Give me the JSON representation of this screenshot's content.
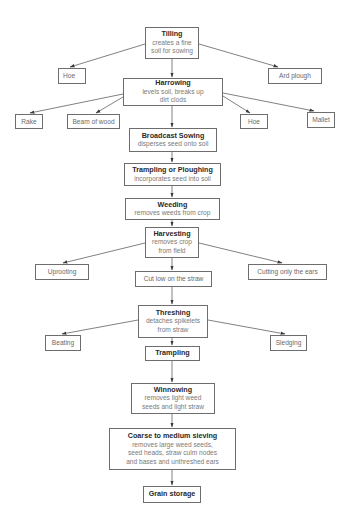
{
  "diagram": {
    "type": "flowchart",
    "title": "",
    "nodes": {
      "tilling": {
        "title": "Tilling",
        "desc": "creates a fine\nsoil for sowing"
      },
      "hoe1": {
        "label": "Hoe"
      },
      "ard_plough": {
        "label": "Ard plough"
      },
      "harrowing": {
        "title": "Harrowing",
        "desc": "levels soil, breaks up\ndirt clods"
      },
      "rake": {
        "label": "Rake"
      },
      "beam_of_wood": {
        "label": "Beam of wood"
      },
      "hoe2": {
        "label": "Hoe"
      },
      "mallet": {
        "label": "Mallet"
      },
      "broadcast_sowing": {
        "title": "Broadcast Sowing",
        "desc": "disperses seed onto soil"
      },
      "trampling_ploughing": {
        "title": "Trampling or Ploughing",
        "desc": "incorporates seed into soil"
      },
      "weeding": {
        "title": "Weeding",
        "desc": "removes weeds from crop"
      },
      "harvesting": {
        "title": "Harvesting",
        "desc": "removes crop\nfrom field"
      },
      "uprooting": {
        "label": "Uprooting"
      },
      "cut_low": {
        "label": "Cut low on the straw"
      },
      "cutting_ears": {
        "label": "Cutting only the ears"
      },
      "threshing": {
        "title": "Threshing",
        "desc": "detaches spikelets\nfrom straw"
      },
      "beating": {
        "label": "Beating"
      },
      "sledging": {
        "label": "Sledging"
      },
      "trampling": {
        "title": "Trampling"
      },
      "winnowing": {
        "title": "Winnowing",
        "desc": "removes light weed\nseeds and light straw"
      },
      "sieving": {
        "title": "Coarse to medium sieving",
        "desc": "removes large weed seeds,\nseed heads, straw culm nodes\nand bases and unthreshed ears"
      },
      "grain_storage": {
        "title": "Grain storage"
      }
    },
    "edges": [
      [
        "tilling",
        "hoe1"
      ],
      [
        "tilling",
        "ard_plough"
      ],
      [
        "tilling",
        "harrowing"
      ],
      [
        "harrowing",
        "rake"
      ],
      [
        "harrowing",
        "beam_of_wood"
      ],
      [
        "harrowing",
        "hoe2"
      ],
      [
        "harrowing",
        "mallet"
      ],
      [
        "harrowing",
        "broadcast_sowing"
      ],
      [
        "broadcast_sowing",
        "trampling_ploughing"
      ],
      [
        "trampling_ploughing",
        "weeding"
      ],
      [
        "weeding",
        "harvesting"
      ],
      [
        "harvesting",
        "uprooting"
      ],
      [
        "harvesting",
        "cut_low"
      ],
      [
        "harvesting",
        "cutting_ears"
      ],
      [
        "cut_low",
        "threshing"
      ],
      [
        "threshing",
        "beating"
      ],
      [
        "threshing",
        "sledging"
      ],
      [
        "threshing",
        "trampling"
      ],
      [
        "trampling",
        "winnowing"
      ],
      [
        "winnowing",
        "sieving"
      ],
      [
        "sieving",
        "grain_storage"
      ]
    ],
    "colors": {
      "border": "#6d6d6d",
      "title_text": "#2a2a2a",
      "desc_text": "#7a7a7a",
      "arrow": "#4a4a4a"
    }
  }
}
